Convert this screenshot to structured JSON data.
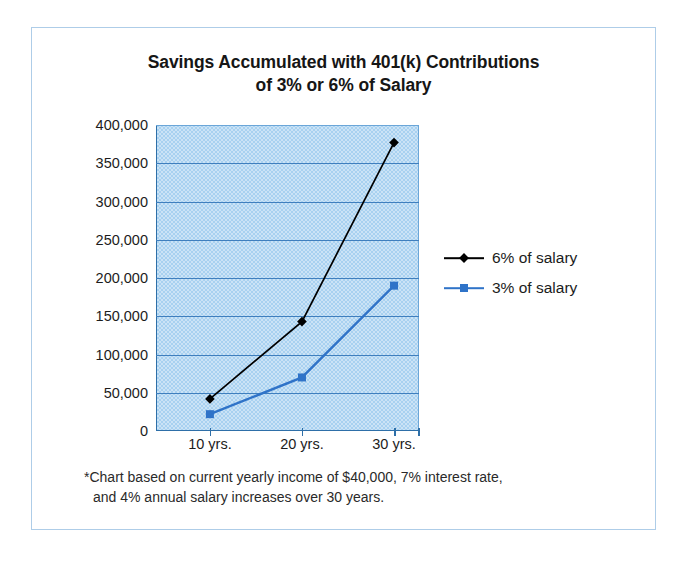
{
  "chart_data": {
    "type": "line",
    "title": "Savings Accumulated with 401(k) Contributions of 3% or 6% of Salary",
    "title_lines": [
      "Savings Accumulated with 401(k) Contributions",
      "of 3% or 6% of Salary"
    ],
    "categories": [
      "10 yrs.",
      "20 yrs.",
      "30 yrs."
    ],
    "series": [
      {
        "name": "6% of salary",
        "values": [
          42000,
          143000,
          377000
        ],
        "color": "#000000",
        "marker": "diamond"
      },
      {
        "name": "3% of salary",
        "values": [
          22000,
          70000,
          190000
        ],
        "color": "#2f73c8",
        "marker": "square"
      }
    ],
    "xlabel": "",
    "ylabel": "",
    "ylim": [
      0,
      400000
    ],
    "ytick_step": 50000,
    "ytick_labels": [
      "400,000",
      "350,000",
      "300,000",
      "250,000",
      "200,000",
      "150,000",
      "100,000",
      "50,000",
      "0"
    ],
    "ytick_values": [
      400000,
      350000,
      300000,
      250000,
      200000,
      150000,
      100000,
      50000,
      0
    ],
    "grid": true,
    "legend_position": "right",
    "plot_background_color": "#a8d1f0",
    "grid_color": "#3f7fbe",
    "axis_color": "#2e6fa8",
    "border_color": "#aecde8",
    "annotation_lines": [
      "*Chart based on current yearly income of $40,000, 7% interest rate,",
      "and 4% annual salary increases over 30 years."
    ],
    "annotation": "*Chart based on current yearly income of $40,000, 7% interest rate, and 4% annual salary increases over 30 years."
  }
}
